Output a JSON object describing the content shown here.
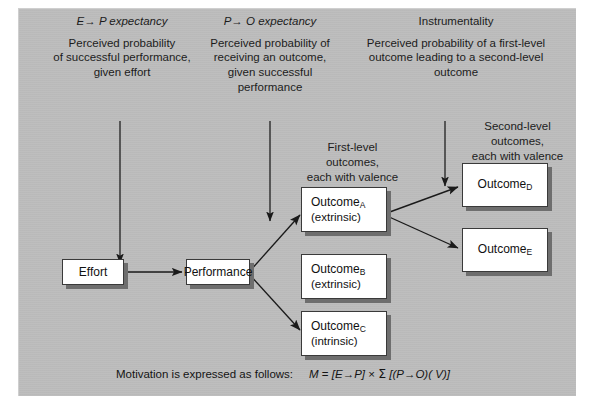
{
  "figure": {
    "type": "flow-diagram",
    "background_color": "#bdbdbd",
    "box_fill": "#ffffff",
    "box_border": "#3a3a3a",
    "shadow_color": "#6e6e6e"
  },
  "headers": [
    {
      "id": "ep",
      "title_pre": "E",
      "title_arrow": "→",
      "title_post": "P expectancy",
      "lines": [
        "Perceived probability",
        "of successful performance,",
        "given effort"
      ]
    },
    {
      "id": "po",
      "title_pre": "P",
      "title_arrow": "→",
      "title_post": "O expectancy",
      "lines": [
        "Perceived probability of",
        "receiving an outcome,",
        "given successful",
        "performance"
      ]
    },
    {
      "id": "instrumentality",
      "title_pre": "",
      "title_arrow": "",
      "title_post": "Instrumentality",
      "lines": [
        "Perceived probability of a first-level",
        "outcome leading to a second-level",
        "outcome"
      ]
    }
  ],
  "group_labels": [
    {
      "id": "first-level",
      "lines": [
        "First-level",
        "outcomes,",
        "each with valence"
      ]
    },
    {
      "id": "second-level",
      "lines": [
        "Second-level",
        "outcomes,",
        "each with valence"
      ]
    }
  ],
  "boxes": [
    {
      "id": "effort",
      "label": "Effort",
      "sub": "",
      "paren": ""
    },
    {
      "id": "performance",
      "label": "Performance",
      "sub": "",
      "paren": ""
    },
    {
      "id": "outcome-a",
      "label": "Outcome",
      "sub": "A",
      "paren": "(extrinsic)"
    },
    {
      "id": "outcome-b",
      "label": "Outcome",
      "sub": "B",
      "paren": "(extrinsic)"
    },
    {
      "id": "outcome-c",
      "label": "Outcome",
      "sub": "C",
      "paren": "(intrinsic)"
    },
    {
      "id": "outcome-d",
      "label": "Outcome",
      "sub": "D",
      "paren": ""
    },
    {
      "id": "outcome-e",
      "label": "Outcome",
      "sub": "E",
      "paren": ""
    }
  ],
  "formula": {
    "lead": "Motivation is expressed as follows:",
    "expr_m": "M",
    "expr_eq": "=",
    "expr_ep": "[E→P]",
    "expr_times": "×",
    "expr_sigma": "Σ",
    "expr_po": "[(P→O)( V)]"
  },
  "caption": {
    "text": ""
  }
}
